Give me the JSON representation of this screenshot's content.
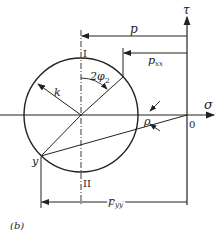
{
  "figure": {
    "panel_label": "(b)"
  },
  "axes": {
    "horizontal_label": "σ",
    "vertical_label": "τ",
    "origin_label": "0"
  },
  "labels": {
    "top_point": "I",
    "bottom_point": "II",
    "radius": "k",
    "angle_main": "2φ",
    "angle_sub": "2",
    "point_y": "y",
    "rho": "ρ",
    "p": "p",
    "pxx_main": "p",
    "pxx_sub": "xx",
    "pyy_main": "p",
    "pyy_sub": "yy"
  },
  "colors": {
    "line": "#222222",
    "background": "#ffffff"
  }
}
